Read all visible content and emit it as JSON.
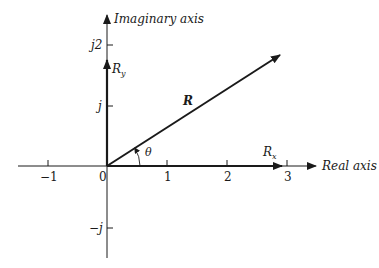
{
  "diagram": {
    "type": "complex-plane-phasor",
    "axes": {
      "real_label": "Real axis",
      "imag_label": "Imaginary axis",
      "origin_label": "0",
      "real_ticks": [
        "−1",
        "1",
        "2",
        "3"
      ],
      "imag_ticks": [
        "j2",
        "j",
        "−j"
      ]
    },
    "vectors": {
      "resultant_label": "R",
      "real_component_label": "R",
      "real_component_sub": "x",
      "imag_component_label": "R",
      "imag_component_sub": "y"
    },
    "angle_label": "θ",
    "colors": {
      "line": "#1a1a1a",
      "background": "#ffffff"
    }
  }
}
